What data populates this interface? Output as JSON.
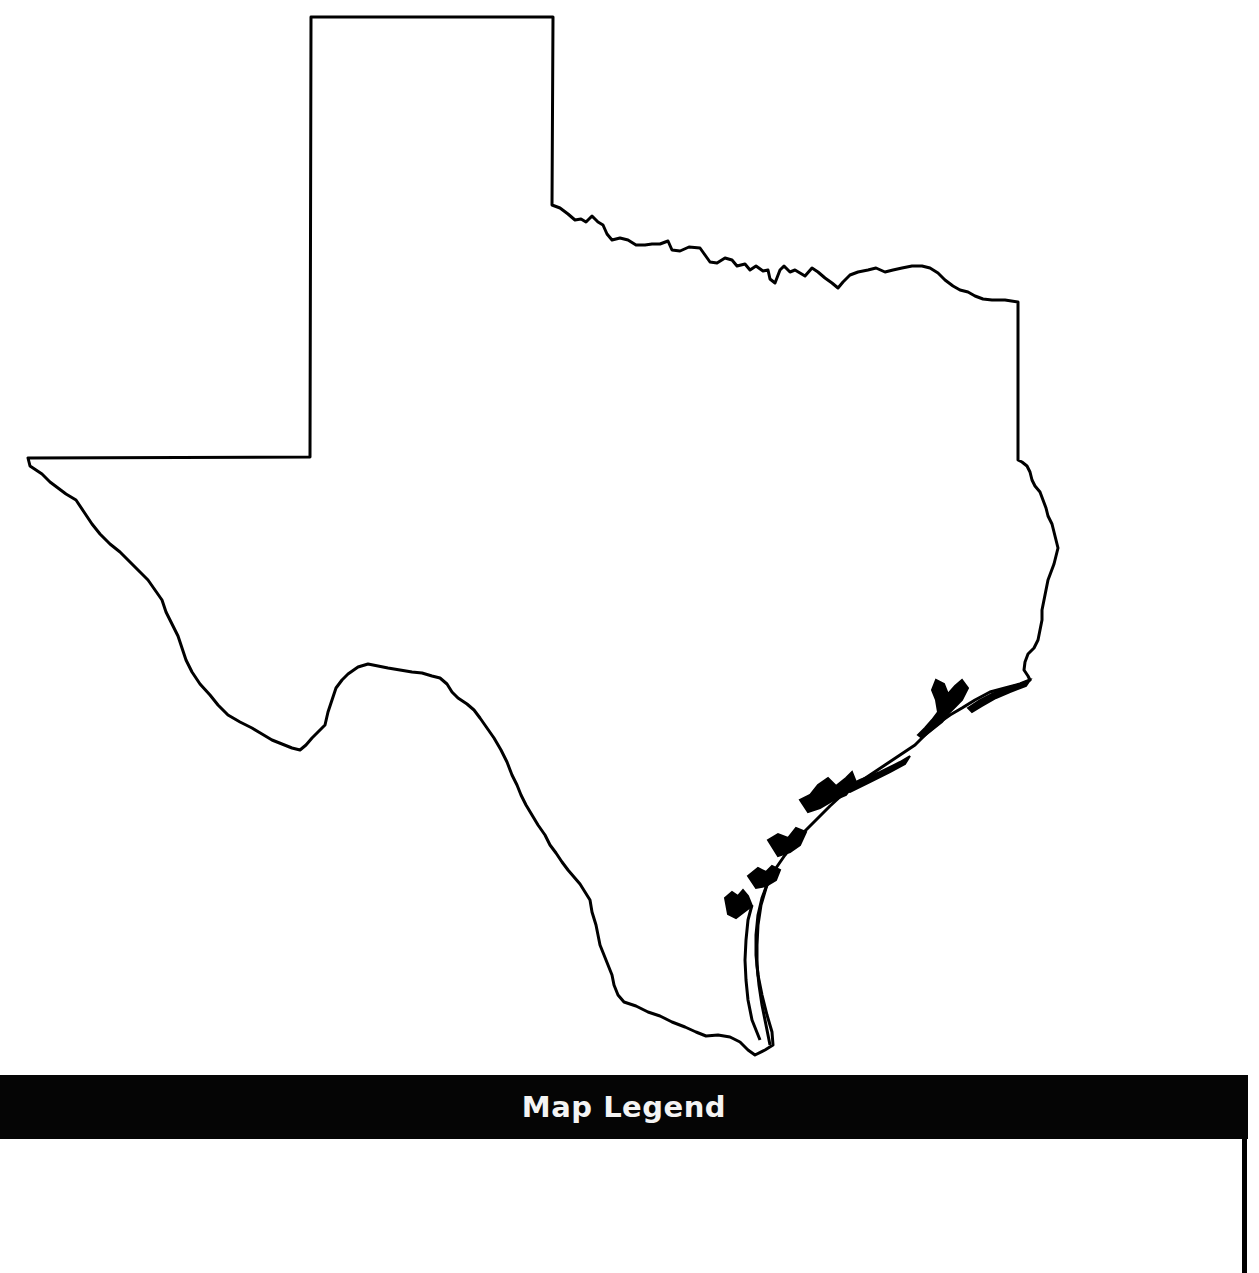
{
  "map": {
    "subject": "Texas state outline (blank)",
    "stroke_color": "#000000",
    "fill_color": "#ffffff"
  },
  "legend": {
    "title": "Map Legend",
    "bar_color": "#050505",
    "title_color": "#f4f4f4",
    "entries": []
  }
}
